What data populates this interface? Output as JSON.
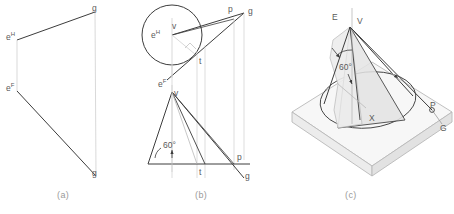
{
  "figure": {
    "domain": "technical-drawing",
    "captions": {
      "a": "(a)",
      "b": "(b)",
      "c": "(c)"
    },
    "colors": {
      "background": "#ffffff",
      "primary_line": "#3c3c3c",
      "light_line": "#b9b9b9",
      "construction_line": "#cfcfcf",
      "label_text": "#5a5a5a",
      "caption_text": "#9a9a9a",
      "shade_fill": "#e9e9e9",
      "plane_fill": "#f2f2f2"
    }
  },
  "panel_a": {
    "name": "two-view orthographic",
    "labels": {
      "e_h": {
        "text": "e",
        "sup": "H",
        "x": 6,
        "y": 31
      },
      "e_f": {
        "text": "e",
        "sup": "F",
        "x": 6,
        "y": 82
      },
      "g_top": {
        "text": "g",
        "x": 92,
        "y": 3
      },
      "g_bottom": {
        "text": "g",
        "x": 92,
        "y": 168
      }
    }
  },
  "panel_b": {
    "name": "cone construction, top and front views",
    "angle_label": "60°",
    "labels": {
      "e_h": {
        "text": "e",
        "sup": "H",
        "x": 151,
        "y": 29
      },
      "v_top": {
        "text": "v",
        "x": 172,
        "y": 21
      },
      "p_top": {
        "text": "p",
        "x": 228,
        "y": 4
      },
      "g_top": {
        "text": "g",
        "x": 248,
        "y": 6
      },
      "t_top": {
        "text": "t",
        "x": 199,
        "y": 56
      },
      "e_f": {
        "text": "e",
        "sup": "F",
        "x": 158,
        "y": 78
      },
      "v_front": {
        "text": "v",
        "x": 174,
        "y": 88
      },
      "angle": {
        "text": "60°",
        "x": 163,
        "y": 140
      },
      "t_bottom": {
        "text": "t",
        "x": 199,
        "y": 167
      },
      "p_bottom": {
        "text": "p",
        "x": 237,
        "y": 152
      },
      "g_bottom": {
        "text": "g",
        "x": 245,
        "y": 171
      }
    }
  },
  "panel_c": {
    "name": "pictorial view of cone on plane",
    "angle_label": "60°",
    "labels": {
      "E": {
        "text": "E",
        "x": 332,
        "y": 12
      },
      "V": {
        "text": "V",
        "x": 357,
        "y": 16
      },
      "angle": {
        "text": "60°",
        "x": 339,
        "y": 62
      },
      "X": {
        "text": "X",
        "x": 369,
        "y": 113
      },
      "P": {
        "text": "P",
        "x": 430,
        "y": 104
      },
      "G": {
        "text": "G",
        "x": 440,
        "y": 127
      }
    }
  }
}
